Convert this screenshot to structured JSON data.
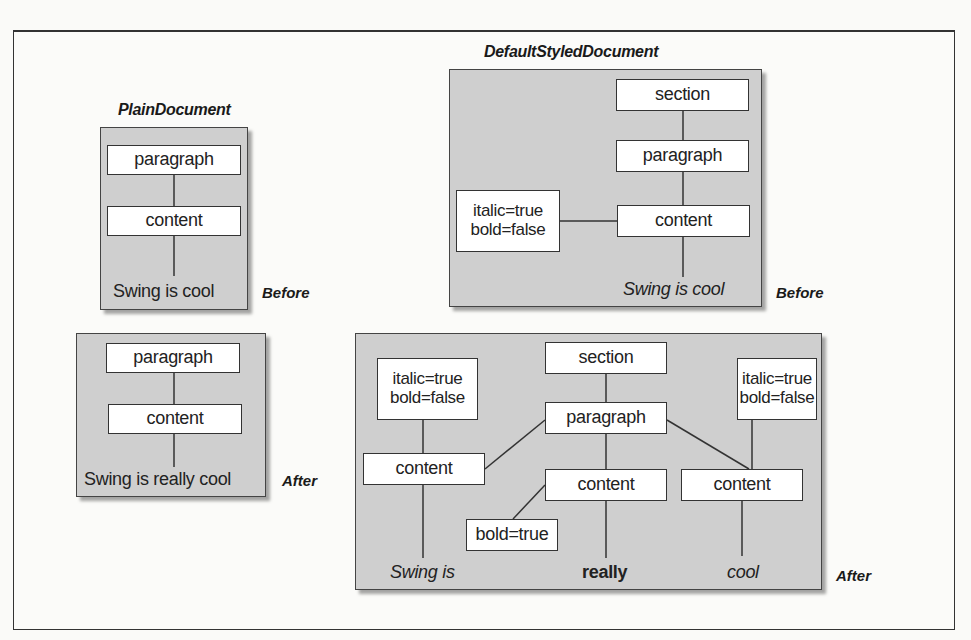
{
  "diagram": {
    "plain_document": {
      "title": "PlainDocument",
      "before": {
        "label": "Before",
        "nodes": [
          "paragraph",
          "content"
        ],
        "text": "Swing is cool"
      },
      "after": {
        "label": "After",
        "nodes": [
          "paragraph",
          "content"
        ],
        "text": "Swing is really cool"
      }
    },
    "default_styled_document": {
      "title": "DefaultStyledDocument",
      "before": {
        "label": "Before",
        "section": "section",
        "paragraph": "paragraph",
        "content": "content",
        "attributes": [
          "italic=true",
          "bold=false"
        ],
        "text": "Swing is cool"
      },
      "after": {
        "label": "After",
        "section": "section",
        "paragraph": "paragraph",
        "contents": [
          {
            "label": "content",
            "attributes": [
              "italic=true",
              "bold=false"
            ],
            "text": "Swing is"
          },
          {
            "label": "content",
            "attributes": [
              "bold=true"
            ],
            "text": "really"
          },
          {
            "label": "content",
            "attributes": [
              "italic=true",
              "bold=false"
            ],
            "text": "cool"
          }
        ]
      }
    }
  }
}
